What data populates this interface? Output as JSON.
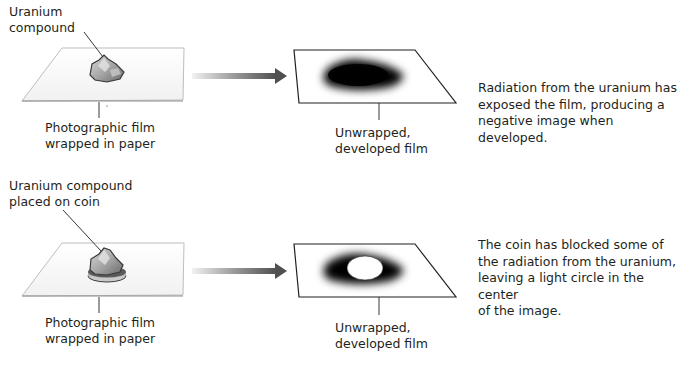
{
  "rows": [
    {
      "source_label": [
        "Uranium",
        "compound"
      ],
      "film_label": [
        "Photographic film",
        "wrapped in paper"
      ],
      "developed_label": [
        "Unwrapped,",
        "developed film"
      ],
      "description": [
        "Radiation from the uranium has",
        "exposed the film, producing a",
        "negative image when developed."
      ],
      "has_coin": false,
      "image_result": "dark-blob"
    },
    {
      "source_label": [
        "Uranium compound",
        "placed on coin"
      ],
      "film_label": [
        "Photographic film",
        "wrapped in paper"
      ],
      "developed_label": [
        "Unwrapped,",
        "developed film"
      ],
      "description": [
        "The coin has blocked some of",
        "the radiation from the uranium,",
        "leaving a light circle in the center",
        "of the image."
      ],
      "has_coin": true,
      "image_result": "dark-ring-with-light-center"
    }
  ],
  "colors": {
    "text": "#231f20",
    "film_outline": "#231f20",
    "arrow_dark": "#555555",
    "arrow_light": "#e6e6e6",
    "exposure": "#000000"
  }
}
